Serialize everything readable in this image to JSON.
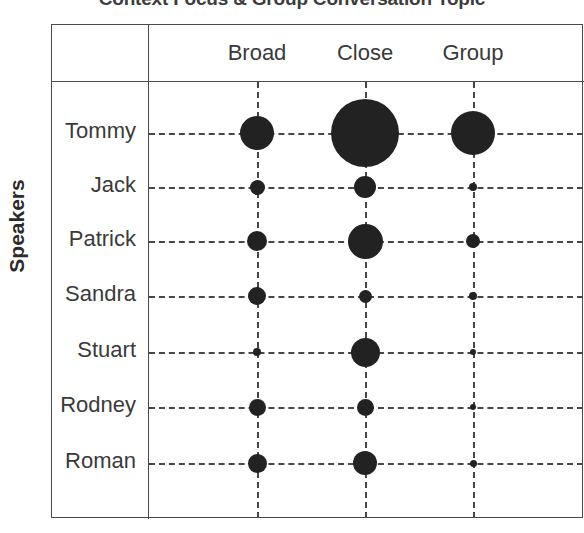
{
  "chart_data": {
    "type": "bubble",
    "title": "Context Focus & Group Conversation Topic",
    "xlabel": "",
    "ylabel": "Speakers",
    "grid": true,
    "legend": "none",
    "bubble_color": "#222222",
    "grid_color": "#474747",
    "frame_color": "#4a4a4a",
    "categories": [
      "Broad",
      "Close",
      "Group"
    ],
    "rows": [
      "Tommy",
      "Jack",
      "Patrick",
      "Sandra",
      "Stuart",
      "Rodney",
      "Roman"
    ],
    "series": [
      {
        "name": "Tommy",
        "values": [
          34,
          68,
          44
        ]
      },
      {
        "name": "Jack",
        "values": [
          15,
          22,
          8
        ]
      },
      {
        "name": "Patrick",
        "values": [
          20,
          35,
          14
        ]
      },
      {
        "name": "Sandra",
        "values": [
          18,
          13,
          8
        ]
      },
      {
        "name": "Stuart",
        "values": [
          8,
          29,
          6
        ]
      },
      {
        "name": "Rodney",
        "values": [
          17,
          17,
          6
        ]
      },
      {
        "name": "Roman",
        "values": [
          19,
          24,
          7
        ]
      }
    ],
    "note": "values are bubble diameters in pixels as read off the plot"
  },
  "layout": {
    "col_x": [
      205,
      313,
      421
    ],
    "row_y": [
      108,
      162,
      216,
      271,
      327,
      382,
      438
    ]
  },
  "axis": {
    "y_label": "Speakers"
  },
  "header": {
    "title": "Context Focus & Group Conversation Topic"
  }
}
